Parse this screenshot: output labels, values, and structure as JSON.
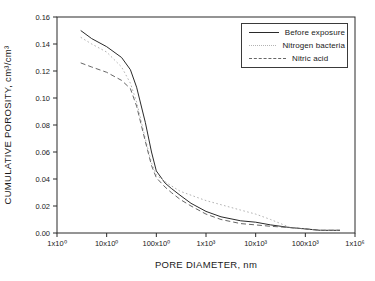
{
  "figure": {
    "background": "#ffffff",
    "frame_color": "#2a2a2a",
    "text_color": "#1a1a1a"
  },
  "chart_data": {
    "type": "line",
    "title": "",
    "xlabel": "PORE DIAMETER, nm",
    "ylabel": "CUMULATIVE POROSITY, cm³/cm³",
    "x_scale": "log",
    "xlim_log10": [
      0,
      6
    ],
    "ylim": [
      0,
      0.16
    ],
    "grid": false,
    "legend_position": "top-right",
    "x_tick_labels": [
      "1x10⁰",
      "10x10⁰",
      "100x10⁰",
      "1x10³",
      "10x10³",
      "100x10³",
      "1x10⁶"
    ],
    "y_ticks": [
      0,
      0.02,
      0.04,
      0.06,
      0.08,
      0.1,
      0.12,
      0.14,
      0.16
    ],
    "y_tick_labels": [
      "0.00",
      "0.02",
      "0.04",
      "0.06",
      "0.08",
      "0.10",
      "0.12",
      "0.14",
      "0.16"
    ],
    "x": [
      3,
      5,
      10,
      20,
      30,
      40,
      60,
      80,
      100,
      150,
      200,
      300,
      500,
      1000,
      2000,
      5000,
      10000,
      20000,
      50000,
      100000,
      200000,
      500000
    ],
    "series": [
      {
        "name": "Before exposure",
        "style": "solid",
        "color": "#2a2a2a",
        "values": [
          0.15,
          0.144,
          0.138,
          0.13,
          0.121,
          0.108,
          0.082,
          0.06,
          0.046,
          0.037,
          0.033,
          0.028,
          0.022,
          0.016,
          0.012,
          0.009,
          0.008,
          0.006,
          0.004,
          0.003,
          0.002,
          0.002
        ]
      },
      {
        "name": "Nitrogen bacteria",
        "style": "dotted",
        "color": "#b3b3b3",
        "values": [
          0.145,
          0.14,
          0.134,
          0.123,
          0.111,
          0.097,
          0.07,
          0.052,
          0.043,
          0.038,
          0.035,
          0.031,
          0.028,
          0.024,
          0.021,
          0.017,
          0.014,
          0.01,
          0.004,
          0.003,
          0.002,
          0.002
        ]
      },
      {
        "name": "Nitric acid",
        "style": "dashed",
        "color": "#666666",
        "values": [
          0.126,
          0.123,
          0.119,
          0.113,
          0.107,
          0.094,
          0.068,
          0.05,
          0.041,
          0.034,
          0.03,
          0.025,
          0.02,
          0.014,
          0.01,
          0.007,
          0.006,
          0.005,
          0.004,
          0.003,
          0.002,
          0.002
        ]
      }
    ]
  }
}
